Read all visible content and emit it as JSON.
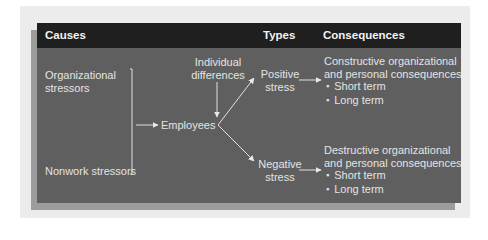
{
  "header": {
    "causes": "Causes",
    "types": "Types",
    "consequences": "Consequences"
  },
  "causes": {
    "organizational_line1": "Organizational",
    "organizational_line2": "stressors",
    "nonwork": "Nonwork stressors"
  },
  "moderator": {
    "line1": "Individual",
    "line2": "differences"
  },
  "center_node": "Employees",
  "types": {
    "positive_line1": "Positive",
    "positive_line2": "stress",
    "negative_line1": "Negative",
    "negative_line2": "stress"
  },
  "consequences": {
    "constructive": {
      "line1": "Constructive organizational",
      "line2": "and personal consequences",
      "items": [
        "Short term",
        "Long term"
      ]
    },
    "destructive": {
      "line1": "Destructive organizational",
      "line2": "and personal consequences",
      "items": [
        "Short term",
        "Long term"
      ]
    }
  },
  "colors": {
    "header_bg": "#1f1f1f",
    "body_bg": "#5f5f5f",
    "shadow": "#9c9c9c",
    "outer_panel": "#ececec",
    "text": "#e4e4e4"
  }
}
